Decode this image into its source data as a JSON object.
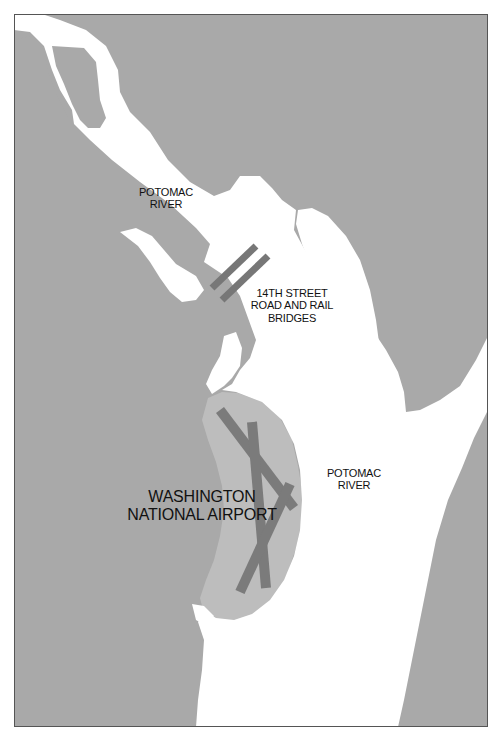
{
  "map": {
    "title": "Potomac River near Washington National Airport",
    "colors": {
      "land": "#a9a9a9",
      "airport_land": "#bdbdbd",
      "water": "#ffffff",
      "runway": "#7b7b7b",
      "bridge": "#777777",
      "frame": "#555555",
      "text": "#111111"
    },
    "labels": {
      "river_upper": {
        "line1": "POTOMAC",
        "line2": "RIVER"
      },
      "bridges": {
        "line1": "14TH STREET",
        "line2": "ROAD AND RAIL",
        "line3": "BRIDGES"
      },
      "river_lower": {
        "line1": "POTOMAC",
        "line2": "RIVER"
      },
      "airport": {
        "line1": "WASHINGTON",
        "line2": "NATIONAL AIRPORT"
      }
    },
    "features": [
      {
        "type": "river",
        "name": "Potomac River"
      },
      {
        "type": "bridge",
        "name": "14th Street Road Bridge"
      },
      {
        "type": "bridge",
        "name": "14th Street Rail Bridge"
      },
      {
        "type": "airport",
        "name": "Washington National Airport",
        "runways": 3
      }
    ]
  }
}
